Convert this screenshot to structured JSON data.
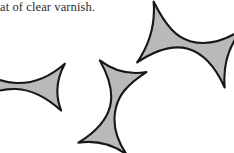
{
  "page": {
    "background_color": "#ffffff",
    "width": 234,
    "height": 153
  },
  "caption": {
    "text": "at of clear varnish.",
    "note": "line is cropped at the left edge of the scan",
    "color": "#2b2b2b"
  },
  "figure": {
    "name": "three-astroid-shapes",
    "shape_fill_color": "#b9b9b9",
    "shape_outline_color": "#171717",
    "shape_count": 3,
    "shapes": [
      {
        "name": "shape-left",
        "label": "left shape",
        "orientation": "horizontal",
        "rotation_deg": 2,
        "clipped": "left edge",
        "center": {
          "x": 18,
          "y": 86
        },
        "size": {
          "width": 92,
          "height": 48
        }
      },
      {
        "name": "shape-middle",
        "label": "middle shape",
        "orientation": "vertical",
        "rotation_deg": 104,
        "clipped": "none",
        "center": {
          "x": 113,
          "y": 107
        },
        "size": {
          "width": 78,
          "height": 84
        }
      },
      {
        "name": "shape-right",
        "label": "top right shape",
        "orientation": "horizontal",
        "rotation_deg": 16,
        "clipped": "none",
        "center": {
          "x": 189,
          "y": 44
        },
        "size": {
          "width": 92,
          "height": 72
        }
      }
    ]
  }
}
